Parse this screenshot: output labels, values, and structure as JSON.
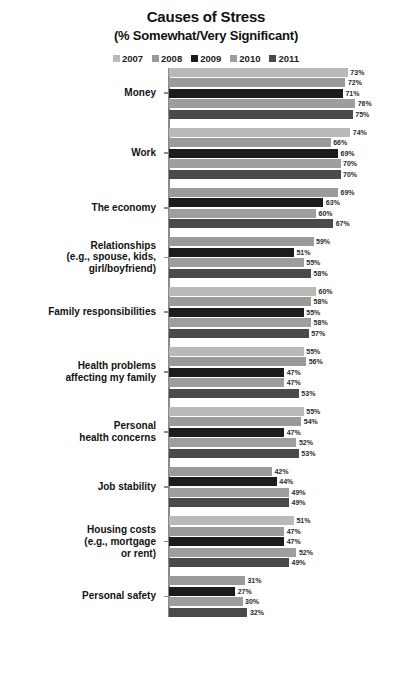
{
  "header": {
    "title": "Causes of Stress",
    "subtitle": "(% Somewhat/Very Significant)"
  },
  "legend": [
    {
      "label": "2007",
      "color": "#b9b9b9"
    },
    {
      "label": "2008",
      "color": "#9a9a9a"
    },
    {
      "label": "2009",
      "color": "#1c1c1c"
    },
    {
      "label": "2010",
      "color": "#9e9e9e"
    },
    {
      "label": "2011",
      "color": "#4a4a4a"
    }
  ],
  "chart_data": {
    "type": "bar",
    "orientation": "horizontal",
    "title": "Causes of Stress",
    "subtitle": "(% Somewhat/Very Significant)",
    "xlabel": "",
    "ylabel": "",
    "xlim": [
      0,
      80
    ],
    "grid": false,
    "legend_position": "top",
    "value_suffix": "%",
    "series": [
      {
        "name": "2007",
        "color": "#b9b9b9"
      },
      {
        "name": "2008",
        "color": "#9a9a9a"
      },
      {
        "name": "2009",
        "color": "#1c1c1c"
      },
      {
        "name": "2010",
        "color": "#9e9e9e"
      },
      {
        "name": "2011",
        "color": "#4a4a4a"
      }
    ],
    "categories": [
      "Money",
      "Work",
      "The economy",
      "Relationships (e.g., spouse, kids, girl/boyfriend)",
      "Family responsibilities",
      "Health problems affecting my family",
      "Personal health concerns",
      "Job stability",
      "Housing costs (e.g., mortgage or rent)",
      "Personal safety"
    ],
    "groups": [
      {
        "category": "Money",
        "label_lines": [
          "Money"
        ],
        "bars": [
          {
            "year": "2007",
            "value": 73,
            "label": "73%",
            "color": "#b9b9b9"
          },
          {
            "year": "2008",
            "value": 72,
            "label": "72%",
            "color": "#9a9a9a"
          },
          {
            "year": "2009",
            "value": 71,
            "label": "71%",
            "color": "#1c1c1c"
          },
          {
            "year": "2010",
            "value": 76,
            "label": "76%",
            "color": "#9e9e9e"
          },
          {
            "year": "2011",
            "value": 75,
            "label": "75%",
            "color": "#4a4a4a"
          }
        ]
      },
      {
        "category": "Work",
        "label_lines": [
          "Work"
        ],
        "bars": [
          {
            "year": "2007",
            "value": 74,
            "label": "74%",
            "color": "#b9b9b9"
          },
          {
            "year": "2008",
            "value": 66,
            "label": "66%",
            "color": "#9a9a9a"
          },
          {
            "year": "2009",
            "value": 69,
            "label": "69%",
            "color": "#1c1c1c"
          },
          {
            "year": "2010",
            "value": 70,
            "label": "70%",
            "color": "#9e9e9e"
          },
          {
            "year": "2011",
            "value": 70,
            "label": "70%",
            "color": "#4a4a4a"
          }
        ]
      },
      {
        "category": "The economy",
        "label_lines": [
          "The economy"
        ],
        "bars": [
          {
            "year": "2008",
            "value": 69,
            "label": "69%",
            "color": "#9a9a9a"
          },
          {
            "year": "2009",
            "value": 63,
            "label": "63%",
            "color": "#1c1c1c"
          },
          {
            "year": "2010",
            "value": 60,
            "label": "60%",
            "color": "#9e9e9e"
          },
          {
            "year": "2011",
            "value": 67,
            "label": "67%",
            "color": "#4a4a4a"
          }
        ]
      },
      {
        "category": "Relationships",
        "label_lines": [
          "Relationships",
          "(e.g., spouse, kids,",
          "girl/boyfriend)"
        ],
        "bars": [
          {
            "year": "2008",
            "value": 59,
            "label": "59%",
            "color": "#9a9a9a"
          },
          {
            "year": "2009",
            "value": 51,
            "label": "51%",
            "color": "#1c1c1c"
          },
          {
            "year": "2010",
            "value": 55,
            "label": "55%",
            "color": "#9e9e9e"
          },
          {
            "year": "2011",
            "value": 58,
            "label": "58%",
            "color": "#4a4a4a"
          }
        ]
      },
      {
        "category": "Family responsibilities",
        "label_lines": [
          "Family responsibilities"
        ],
        "bars": [
          {
            "year": "2007",
            "value": 60,
            "label": "60%",
            "color": "#b9b9b9"
          },
          {
            "year": "2008",
            "value": 58,
            "label": "58%",
            "color": "#9a9a9a"
          },
          {
            "year": "2009",
            "value": 55,
            "label": "55%",
            "color": "#1c1c1c"
          },
          {
            "year": "2010",
            "value": 58,
            "label": "58%",
            "color": "#9e9e9e"
          },
          {
            "year": "2011",
            "value": 57,
            "label": "57%",
            "color": "#4a4a4a"
          }
        ]
      },
      {
        "category": "Health problems affecting my family",
        "label_lines": [
          "Health problems",
          "affecting my family"
        ],
        "bars": [
          {
            "year": "2007",
            "value": 55,
            "label": "55%",
            "color": "#b9b9b9"
          },
          {
            "year": "2008",
            "value": 56,
            "label": "56%",
            "color": "#9a9a9a"
          },
          {
            "year": "2009",
            "value": 47,
            "label": "47%",
            "color": "#1c1c1c"
          },
          {
            "year": "2010",
            "value": 47,
            "label": "47%",
            "color": "#9e9e9e"
          },
          {
            "year": "2011",
            "value": 53,
            "label": "53%",
            "color": "#4a4a4a"
          }
        ]
      },
      {
        "category": "Personal health concerns",
        "label_lines": [
          "Personal",
          "health concerns"
        ],
        "bars": [
          {
            "year": "2007",
            "value": 55,
            "label": "55%",
            "color": "#b9b9b9"
          },
          {
            "year": "2008",
            "value": 54,
            "label": "54%",
            "color": "#9a9a9a"
          },
          {
            "year": "2009",
            "value": 47,
            "label": "47%",
            "color": "#1c1c1c"
          },
          {
            "year": "2010",
            "value": 52,
            "label": "52%",
            "color": "#9e9e9e"
          },
          {
            "year": "2011",
            "value": 53,
            "label": "53%",
            "color": "#4a4a4a"
          }
        ]
      },
      {
        "category": "Job stability",
        "label_lines": [
          "Job stability"
        ],
        "bars": [
          {
            "year": "2008",
            "value": 42,
            "label": "42%",
            "color": "#9a9a9a"
          },
          {
            "year": "2009",
            "value": 44,
            "label": "44%",
            "color": "#1c1c1c"
          },
          {
            "year": "2010",
            "value": 49,
            "label": "49%",
            "color": "#9e9e9e"
          },
          {
            "year": "2011",
            "value": 49,
            "label": "49%",
            "color": "#4a4a4a"
          }
        ]
      },
      {
        "category": "Housing costs",
        "label_lines": [
          "Housing costs",
          "(e.g., mortgage",
          "or rent)"
        ],
        "bars": [
          {
            "year": "2007",
            "value": 51,
            "label": "51%",
            "color": "#b9b9b9"
          },
          {
            "year": "2008",
            "value": 47,
            "label": "47%",
            "color": "#9a9a9a"
          },
          {
            "year": "2009",
            "value": 47,
            "label": "47%",
            "color": "#1c1c1c"
          },
          {
            "year": "2010",
            "value": 52,
            "label": "52%",
            "color": "#9e9e9e"
          },
          {
            "year": "2011",
            "value": 49,
            "label": "49%",
            "color": "#4a4a4a"
          }
        ]
      },
      {
        "category": "Personal safety",
        "label_lines": [
          "Personal safety"
        ],
        "bars": [
          {
            "year": "2008",
            "value": 31,
            "label": "31%",
            "color": "#9a9a9a"
          },
          {
            "year": "2009",
            "value": 27,
            "label": "27%",
            "color": "#1c1c1c"
          },
          {
            "year": "2010",
            "value": 30,
            "label": "30%",
            "color": "#9e9e9e"
          },
          {
            "year": "2011",
            "value": 32,
            "label": "32%",
            "color": "#4a4a4a"
          }
        ]
      }
    ]
  }
}
